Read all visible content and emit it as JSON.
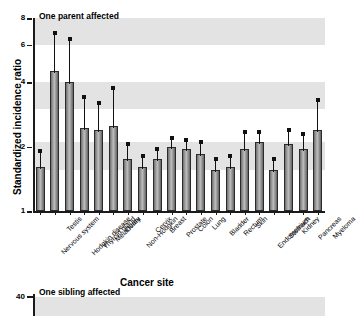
{
  "figure": {
    "axis_labels": {
      "x": "Cancer site",
      "y": "Standardized incidence ratio"
    },
    "panels": [
      {
        "title": "One parent affected"
      },
      {
        "title": "One sibling affected"
      }
    ]
  },
  "chart_data": {
    "type": "bar",
    "title": "One parent affected",
    "xlabel": "Cancer site",
    "ylabel": "Standardized incidence ratio",
    "yscale": "log",
    "ylim": [
      1,
      8
    ],
    "yticks": [
      1,
      2,
      4,
      6,
      8
    ],
    "ytick_labels": [
      "1",
      "2",
      "4",
      "6",
      "8"
    ],
    "grid": false,
    "legend": "none",
    "error_bars": "95% confidence interval",
    "categories": [
      "Nervous system",
      "Testis",
      "Hodgkin disease",
      "Thyroid gland",
      "Melanoma",
      "Ovary",
      "Non-Hodgkin",
      "Cervix",
      "Breast",
      "Prostate",
      "Colon",
      "Lung",
      "Bladder",
      "Rectum",
      "Skin",
      "Endometrium",
      "Stomach",
      "Kidney",
      "Pancreas",
      "Myeloma"
    ],
    "values": [
      1.6,
      4.5,
      4.0,
      2.45,
      2.4,
      2.5,
      1.75,
      1.6,
      1.75,
      2.0,
      1.95,
      1.85,
      1.55,
      1.6,
      1.95,
      2.1,
      1.55,
      2.05,
      1.95,
      2.4
    ],
    "ci_low": [
      1.35,
      3.0,
      2.6,
      1.9,
      1.85,
      1.75,
      1.55,
      1.45,
      1.6,
      1.85,
      1.8,
      1.65,
      1.4,
      1.45,
      1.7,
      1.9,
      1.4,
      1.8,
      1.7,
      1.9
    ],
    "ci_high": [
      1.9,
      6.8,
      6.35,
      3.4,
      3.2,
      3.75,
      2.05,
      1.8,
      1.95,
      2.2,
      2.15,
      2.1,
      1.75,
      1.8,
      2.35,
      2.35,
      1.75,
      2.4,
      2.3,
      3.3
    ],
    "second_panel": {
      "title": "One sibling affected",
      "yticks_visible": [
        40
      ],
      "ytick_labels": [
        "40"
      ]
    }
  },
  "colors": {
    "bar_fill": "#a8a8a8",
    "bar_edge": "#2b2b2b",
    "band": "#e3e3e3",
    "axis": "#1a1a1a",
    "error_bar": "#111111"
  }
}
